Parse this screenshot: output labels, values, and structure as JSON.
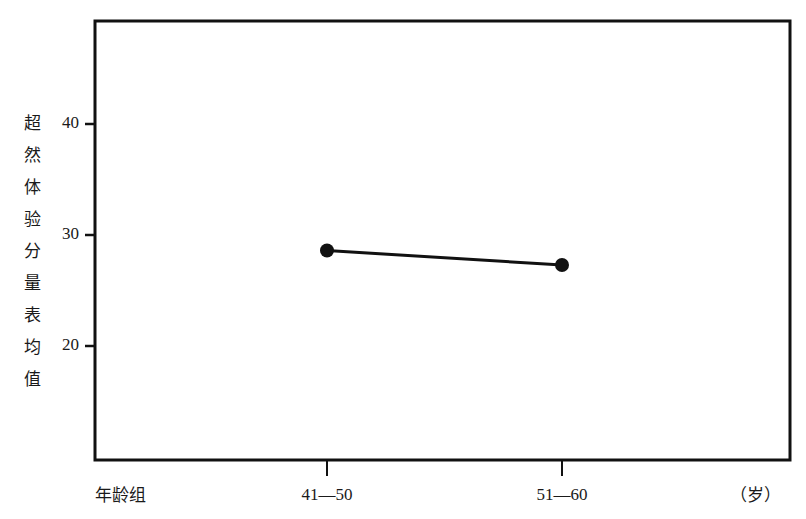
{
  "chart_data": {
    "type": "line",
    "title": "",
    "xlabel": "年龄组",
    "xunit": "（岁）",
    "ylabel": "超然体验分量表均值",
    "ylabel_chars": [
      "超",
      "然",
      "体",
      "验",
      "分",
      "量",
      "表",
      "均",
      "值"
    ],
    "categories": [
      "41—50",
      "51—60"
    ],
    "series": [
      {
        "name": "超然体验分量表均值",
        "values": [
          28.6,
          27.3
        ]
      }
    ],
    "yticks": [
      20,
      30,
      40
    ],
    "ytick_labels": [
      "20",
      "30",
      "40"
    ],
    "ylim": [
      11,
      48
    ],
    "grid": false,
    "legend": null,
    "colors": {
      "line": "#111111",
      "marker": "#111111",
      "frame": "#111111"
    }
  }
}
